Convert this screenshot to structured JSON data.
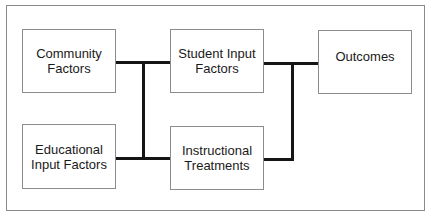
{
  "diagram": {
    "nodes": [
      {
        "id": "community",
        "label": "Community\nFactors"
      },
      {
        "id": "educational",
        "label": "Educational\nInput Factors"
      },
      {
        "id": "student",
        "label": "Student Input\nFactors"
      },
      {
        "id": "instructional",
        "label": "Instructional\nTreatments"
      },
      {
        "id": "outcomes",
        "label": "Outcomes"
      }
    ],
    "edges": [
      {
        "from": [
          "community",
          "educational"
        ],
        "to": [
          "student",
          "instructional"
        ]
      },
      {
        "from": [
          "student",
          "instructional"
        ],
        "to": [
          "outcomes"
        ]
      }
    ],
    "colors": {
      "box_border": "#8c8c8c",
      "connector": "#151515",
      "frame_border": "#8a8a8a",
      "text": "#1a1a1a"
    }
  }
}
